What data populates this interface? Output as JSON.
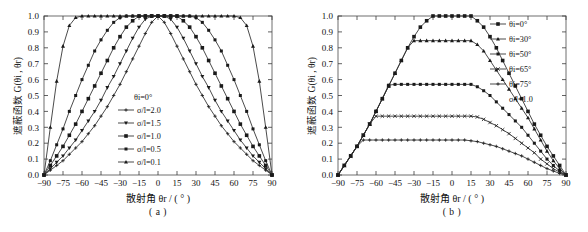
{
  "figure": {
    "panels": [
      {
        "caption": "( a )",
        "xlabel": "散射角 θr / ( ° )",
        "ylabel": "遮蔽函数 G(θi , θr)",
        "legend_title": "θi=0°",
        "legend_items": [
          "σ/l=2.0",
          "σ/l=1.5",
          "σ/l=1.0",
          "σ/l=0.5",
          "σ/l=0.1"
        ],
        "legend_note": ""
      },
      {
        "caption": "( b )",
        "xlabel": "散射角 θr / ( ° )",
        "ylabel": "遮蔽函数 G(θi , θr)",
        "legend_title": "",
        "legend_items": [
          "θi=0°",
          "θi=30°",
          "θi=50°",
          "θi=65°",
          "θi=75°"
        ],
        "legend_note": "σ/l=1.0"
      }
    ],
    "colors": {
      "curve": "#2b2b2b",
      "axis": "#6e6e6e",
      "text": "#111111",
      "background": "#ffffff"
    }
  },
  "chart_data": [
    {
      "type": "line",
      "title": "",
      "subtitle": "( a )",
      "xlabel": "散射角 θr / ( ° )",
      "ylabel": "遮蔽函数 G(θi , θr)",
      "xlim": [
        -90,
        90
      ],
      "ylim": [
        0.0,
        1.0
      ],
      "xticks": [
        -90,
        -75,
        -60,
        -45,
        -30,
        -15,
        0,
        15,
        30,
        45,
        60,
        75,
        90
      ],
      "yticks": [
        0.0,
        0.1,
        0.2,
        0.3,
        0.4,
        0.5,
        0.6,
        0.7,
        0.8,
        0.9,
        1.0
      ],
      "grid": false,
      "legend_position": "center",
      "annotations": [
        "θi=0°"
      ],
      "x": [
        -90,
        -85,
        -80,
        -75,
        -70,
        -65,
        -60,
        -55,
        -50,
        -45,
        -40,
        -35,
        -30,
        -25,
        -20,
        -15,
        -10,
        -5,
        0,
        5,
        10,
        15,
        20,
        25,
        30,
        35,
        40,
        45,
        50,
        55,
        60,
        65,
        70,
        75,
        80,
        85,
        90
      ],
      "series": [
        {
          "name": "σ/l=2.0",
          "marker": "cross",
          "values": [
            0.0,
            0.03,
            0.06,
            0.09,
            0.13,
            0.17,
            0.21,
            0.26,
            0.31,
            0.37,
            0.43,
            0.5,
            0.57,
            0.65,
            0.73,
            0.81,
            0.89,
            0.96,
            1.0,
            0.96,
            0.89,
            0.81,
            0.73,
            0.65,
            0.57,
            0.5,
            0.43,
            0.37,
            0.31,
            0.26,
            0.21,
            0.17,
            0.13,
            0.09,
            0.06,
            0.03,
            0.0
          ]
        },
        {
          "name": "σ/l=1.5",
          "marker": "triangle-down",
          "values": [
            0.0,
            0.04,
            0.08,
            0.12,
            0.17,
            0.22,
            0.28,
            0.34,
            0.4,
            0.47,
            0.55,
            0.62,
            0.7,
            0.78,
            0.86,
            0.93,
            0.98,
            1.0,
            1.0,
            1.0,
            0.98,
            0.93,
            0.86,
            0.78,
            0.7,
            0.62,
            0.55,
            0.47,
            0.4,
            0.34,
            0.28,
            0.22,
            0.17,
            0.12,
            0.08,
            0.04,
            0.0
          ]
        },
        {
          "name": "σ/l=1.0",
          "marker": "square",
          "values": [
            0.0,
            0.06,
            0.12,
            0.18,
            0.25,
            0.32,
            0.4,
            0.48,
            0.56,
            0.64,
            0.72,
            0.8,
            0.87,
            0.93,
            0.97,
            1.0,
            1.0,
            1.0,
            1.0,
            1.0,
            1.0,
            1.0,
            0.97,
            0.93,
            0.87,
            0.8,
            0.72,
            0.64,
            0.56,
            0.48,
            0.4,
            0.32,
            0.25,
            0.18,
            0.12,
            0.06,
            0.0
          ]
        },
        {
          "name": "σ/l=0.5",
          "marker": "square-small",
          "values": [
            0.0,
            0.09,
            0.19,
            0.29,
            0.4,
            0.5,
            0.6,
            0.69,
            0.78,
            0.85,
            0.91,
            0.96,
            0.99,
            1.0,
            1.0,
            1.0,
            1.0,
            1.0,
            1.0,
            1.0,
            1.0,
            1.0,
            1.0,
            1.0,
            0.99,
            0.96,
            0.91,
            0.85,
            0.78,
            0.69,
            0.6,
            0.5,
            0.4,
            0.29,
            0.19,
            0.09,
            0.0
          ]
        },
        {
          "name": "σ/l=0.1",
          "marker": "triangle-up",
          "values": [
            0.0,
            0.3,
            0.59,
            0.81,
            0.94,
            0.99,
            1.0,
            1.0,
            1.0,
            1.0,
            1.0,
            1.0,
            1.0,
            1.0,
            1.0,
            1.0,
            1.0,
            1.0,
            1.0,
            1.0,
            1.0,
            1.0,
            1.0,
            1.0,
            1.0,
            1.0,
            1.0,
            1.0,
            1.0,
            1.0,
            1.0,
            0.99,
            0.94,
            0.81,
            0.59,
            0.3,
            0.0
          ]
        }
      ]
    },
    {
      "type": "line",
      "title": "",
      "subtitle": "( b )",
      "xlabel": "散射角 θr / ( ° )",
      "ylabel": "遮蔽函数 G(θi , θr)",
      "xlim": [
        -90,
        90
      ],
      "ylim": [
        0.0,
        1.0
      ],
      "xticks": [
        -90,
        -75,
        -60,
        -45,
        -30,
        -15,
        0,
        15,
        30,
        45,
        60,
        75,
        90
      ],
      "yticks": [
        0.0,
        0.1,
        0.2,
        0.3,
        0.4,
        0.5,
        0.6,
        0.7,
        0.8,
        0.9,
        1.0
      ],
      "grid": false,
      "legend_position": "top-right",
      "annotations": [
        "σ/l=1.0"
      ],
      "x": [
        -90,
        -85,
        -80,
        -75,
        -70,
        -65,
        -60,
        -55,
        -50,
        -45,
        -40,
        -35,
        -30,
        -25,
        -20,
        -15,
        -10,
        -5,
        0,
        5,
        10,
        15,
        20,
        25,
        30,
        35,
        40,
        45,
        50,
        55,
        60,
        65,
        70,
        75,
        80,
        85,
        90
      ],
      "series": [
        {
          "name": "θi=0°",
          "marker": "square",
          "values": [
            0.0,
            0.06,
            0.12,
            0.18,
            0.25,
            0.32,
            0.4,
            0.48,
            0.56,
            0.64,
            0.72,
            0.8,
            0.87,
            0.93,
            0.97,
            1.0,
            1.0,
            1.0,
            1.0,
            1.0,
            1.0,
            1.0,
            0.97,
            0.93,
            0.87,
            0.8,
            0.72,
            0.64,
            0.56,
            0.48,
            0.4,
            0.32,
            0.25,
            0.18,
            0.12,
            0.06,
            0.0
          ]
        },
        {
          "name": "θi=30°",
          "marker": "triangle-up",
          "values": [
            0.0,
            0.06,
            0.12,
            0.18,
            0.25,
            0.32,
            0.4,
            0.48,
            0.56,
            0.64,
            0.72,
            0.8,
            0.845,
            0.845,
            0.845,
            0.845,
            0.845,
            0.845,
            0.845,
            0.845,
            0.845,
            0.845,
            0.82,
            0.78,
            0.72,
            0.66,
            0.6,
            0.54,
            0.48,
            0.42,
            0.36,
            0.29,
            0.22,
            0.15,
            0.09,
            0.04,
            0.0
          ]
        },
        {
          "name": "θi=50°",
          "marker": "square-small",
          "values": [
            0.0,
            0.06,
            0.12,
            0.18,
            0.25,
            0.32,
            0.4,
            0.48,
            0.565,
            0.57,
            0.57,
            0.57,
            0.57,
            0.57,
            0.57,
            0.57,
            0.57,
            0.57,
            0.57,
            0.57,
            0.57,
            0.57,
            0.555,
            0.53,
            0.5,
            0.46,
            0.42,
            0.38,
            0.34,
            0.3,
            0.25,
            0.2,
            0.15,
            0.1,
            0.06,
            0.025,
            0.0
          ]
        },
        {
          "name": "θi=65°",
          "marker": "x",
          "values": [
            0.0,
            0.06,
            0.12,
            0.18,
            0.25,
            0.32,
            0.37,
            0.37,
            0.37,
            0.37,
            0.37,
            0.37,
            0.37,
            0.37,
            0.37,
            0.37,
            0.37,
            0.37,
            0.37,
            0.37,
            0.37,
            0.37,
            0.365,
            0.35,
            0.33,
            0.31,
            0.285,
            0.26,
            0.23,
            0.2,
            0.17,
            0.14,
            0.1,
            0.07,
            0.04,
            0.018,
            0.0
          ]
        },
        {
          "name": "θi=75°",
          "marker": "plus",
          "values": [
            0.0,
            0.06,
            0.12,
            0.18,
            0.22,
            0.22,
            0.22,
            0.22,
            0.22,
            0.22,
            0.22,
            0.22,
            0.22,
            0.22,
            0.22,
            0.22,
            0.22,
            0.22,
            0.22,
            0.22,
            0.22,
            0.215,
            0.21,
            0.2,
            0.19,
            0.18,
            0.165,
            0.15,
            0.135,
            0.12,
            0.1,
            0.08,
            0.06,
            0.04,
            0.025,
            0.01,
            0.0
          ]
        }
      ]
    }
  ]
}
